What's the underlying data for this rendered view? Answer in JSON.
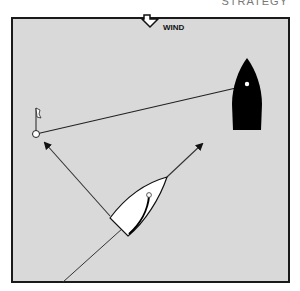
{
  "header": {
    "cut_text": "STRATEGY"
  },
  "wind": {
    "label": "WIND",
    "icon": "down-arrow-outline-icon"
  },
  "colors": {
    "water": "#d9d9d9",
    "frame": "#1a1a1a",
    "line": "#333333",
    "white_boat": "#ffffff",
    "black_boat": "#000000"
  },
  "elements": {
    "frame": {
      "x": 12,
      "y": 18,
      "w": 277,
      "h": 264
    },
    "mark": {
      "type": "buoy-with-flag",
      "cx": 36,
      "cy": 134
    },
    "black_boat": {
      "mast": [
        247,
        84
      ]
    },
    "white_boat": {
      "bow": [
        167,
        177
      ],
      "mast": [
        149,
        195
      ]
    },
    "arrows": [
      {
        "name": "course-to-mark",
        "from": [
          110,
          216
        ],
        "to": [
          43,
          141
        ]
      },
      {
        "name": "course-right",
        "from": [
          167,
          177
        ],
        "to": [
          204,
          142
        ]
      }
    ]
  }
}
